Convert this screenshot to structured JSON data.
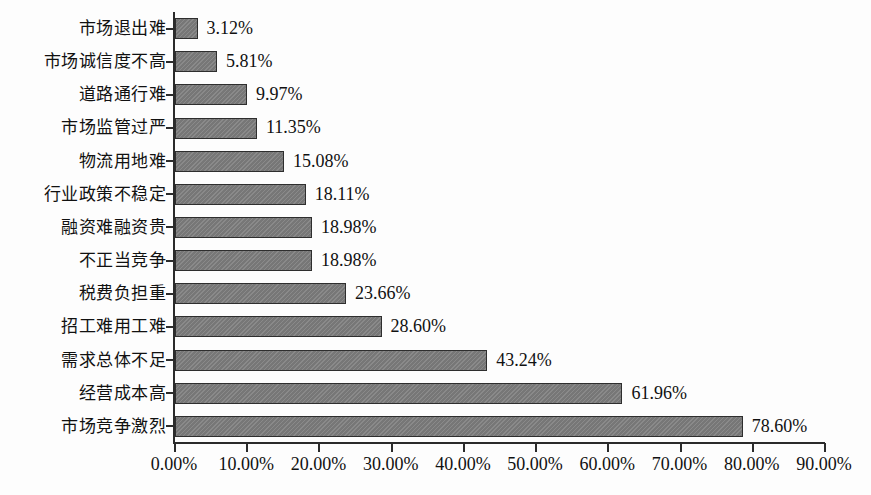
{
  "chart_data": {
    "type": "bar",
    "orientation": "horizontal",
    "title": "",
    "xlabel": "",
    "ylabel": "",
    "xlim": [
      0,
      90
    ],
    "grid": false,
    "legend": null,
    "value_format": "percent",
    "xticks": [
      "0.00%",
      "10.00%",
      "20.00%",
      "30.00%",
      "40.00%",
      "50.00%",
      "60.00%",
      "70.00%",
      "80.00%",
      "90.00%"
    ],
    "xtick_values": [
      0,
      10,
      20,
      30,
      40,
      50,
      60,
      70,
      80,
      90
    ],
    "categories": [
      "市场退出难",
      "市场诚信度不高",
      "道路通行难",
      "市场监管过严",
      "物流用地难",
      "行业政策不稳定",
      "融资难融资贵",
      "不正当竞争",
      "税费负担重",
      "招工难用工难",
      "需求总体不足",
      "经营成本高",
      "市场竞争激烈"
    ],
    "values": [
      3.12,
      5.81,
      9.97,
      11.35,
      15.08,
      18.11,
      18.98,
      18.98,
      23.66,
      28.6,
      43.24,
      61.96,
      78.6
    ],
    "data_labels": [
      "3.12%",
      "5.81%",
      "9.97%",
      "11.35%",
      "15.08%",
      "18.11%",
      "18.98%",
      "18.98%",
      "23.66%",
      "28.60%",
      "43.24%",
      "61.96%",
      "78.60%"
    ],
    "colors": {
      "bar_fill": "#7d7d7d",
      "bar_border": "#2e2e2e",
      "axis": "#2b2b2b",
      "text": "#111111",
      "background": "#fdfdfd"
    }
  }
}
